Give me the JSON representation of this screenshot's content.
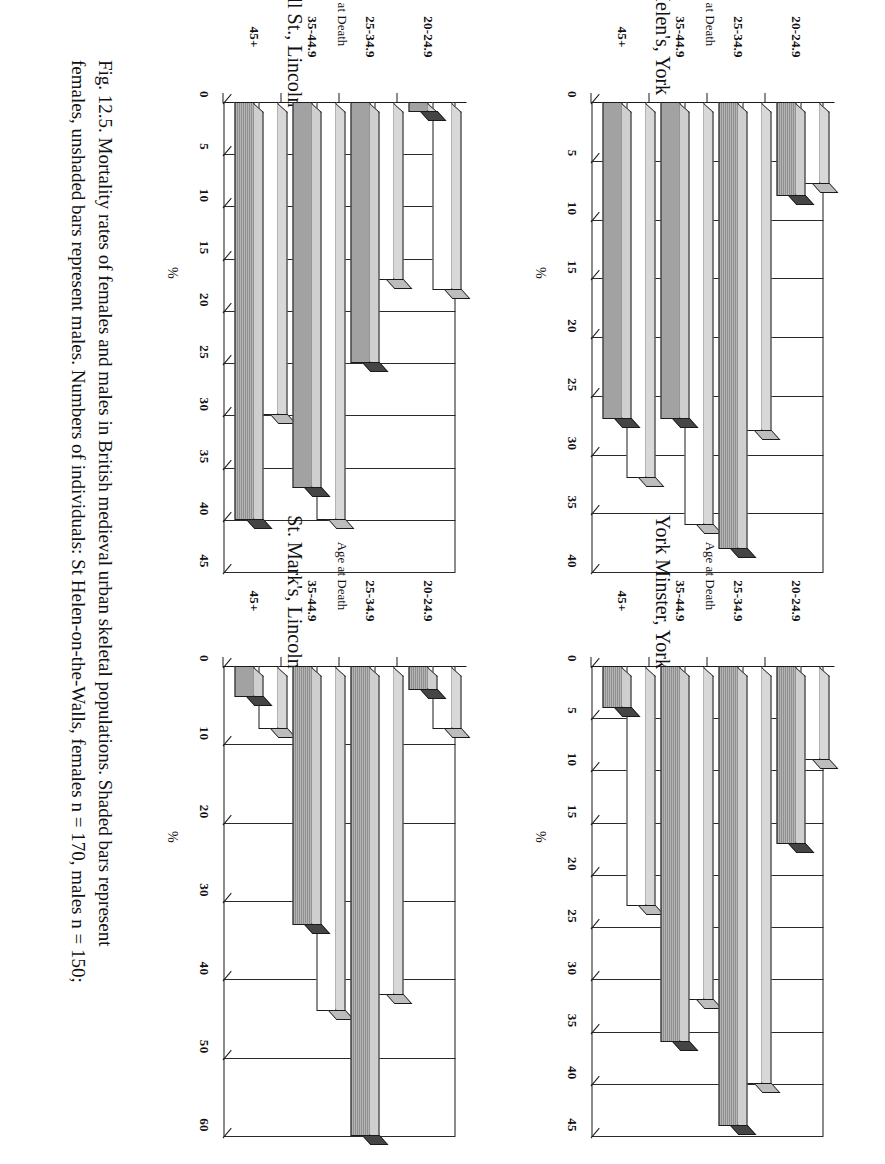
{
  "figure": {
    "caption": "Fig. 12.5. Mortality rates of females and males in British medieval urban skeletal populations. Shaded bars represent females, unshaded bars represent males. Numbers of individuals: St Helen-on-the-Walls, females n = 170, males n = 150;",
    "caption_line1": "Fig. 12.5. Mortality rates of females and males in British medieval urban skeletal populations. Shaded bars represent",
    "caption_line2": "females, unshaded bars represent males. Numbers of individuals: St Helen-on-the-Walls, females n = 170, males n = 150;",
    "legend_note": {
      "shaded_means": "females",
      "unshaded_means": "males"
    }
  },
  "common": {
    "xlabel": "Age at Death",
    "ylabel": "%",
    "categories": [
      "20-24.9",
      "25-34.9",
      "35-44.9",
      "45+"
    ],
    "series_names": [
      "females",
      "males"
    ],
    "colors": {
      "shaded_bar": "#9a9a9a",
      "unshaded_bar": "#ffffff",
      "axis": "#1a1a1a"
    }
  },
  "chart_data": [
    {
      "id": "st-helens-york",
      "type": "bar",
      "title": "St. Helen's, York",
      "xlabel": "Age at Death",
      "ylabel": "%",
      "categories": [
        "20-24.9",
        "25-34.9",
        "35-44.9",
        "45+"
      ],
      "ylim": [
        0,
        40
      ],
      "yticks": [
        0,
        5,
        10,
        15,
        20,
        25,
        30,
        35,
        40
      ],
      "grid": true,
      "legend": "none",
      "series": [
        {
          "name": "females",
          "style": "shaded",
          "values": [
            8,
            38,
            27,
            27
          ]
        },
        {
          "name": "males",
          "style": "unshaded",
          "values": [
            7,
            28,
            36,
            32
          ]
        }
      ]
    },
    {
      "id": "pennell-st-lincoln",
      "type": "bar",
      "title": "Pennell St., Lincoln",
      "xlabel": "Age at Death",
      "ylabel": "%",
      "categories": [
        "20-24.9",
        "25-34.9",
        "35-44.9",
        "45+"
      ],
      "ylim": [
        0,
        45
      ],
      "yticks": [
        0,
        5,
        10,
        15,
        20,
        25,
        30,
        35,
        40,
        45
      ],
      "grid": true,
      "legend": "none",
      "series": [
        {
          "name": "females",
          "style": "shaded",
          "values": [
            1,
            25,
            37,
            40
          ]
        },
        {
          "name": "males",
          "style": "unshaded",
          "values": [
            18,
            17,
            40,
            30
          ]
        }
      ]
    },
    {
      "id": "york-minster-york",
      "type": "bar",
      "title": "York Minster, York",
      "xlabel": "Age at Death",
      "ylabel": "%",
      "categories": [
        "20-24.9",
        "25-34.9",
        "35-44.9",
        "45+"
      ],
      "ylim": [
        0,
        45
      ],
      "yticks": [
        0,
        5,
        10,
        15,
        20,
        25,
        30,
        35,
        40,
        45
      ],
      "grid": true,
      "legend": "none",
      "series": [
        {
          "name": "females",
          "style": "shaded",
          "values": [
            17,
            44,
            36,
            4
          ]
        },
        {
          "name": "males",
          "style": "unshaded",
          "values": [
            9,
            40,
            32,
            23
          ]
        }
      ]
    },
    {
      "id": "st-marks-lincoln",
      "type": "bar",
      "title": "St. Mark's, Lincoln",
      "xlabel": "Age at Death",
      "ylabel": "%",
      "categories": [
        "20-24.9",
        "25-34.9",
        "35-44.9",
        "45+"
      ],
      "ylim": [
        0,
        60
      ],
      "yticks": [
        0,
        10,
        20,
        30,
        40,
        50,
        60
      ],
      "grid": true,
      "legend": "none",
      "series": [
        {
          "name": "females",
          "style": "shaded",
          "values": [
            3,
            60,
            33,
            4
          ]
        },
        {
          "name": "males",
          "style": "unshaded",
          "values": [
            8,
            42,
            44,
            8
          ]
        }
      ]
    }
  ]
}
